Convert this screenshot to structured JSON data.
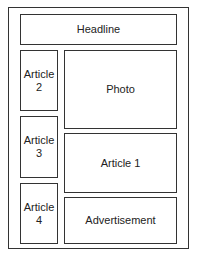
{
  "layout": {
    "headline": {
      "label": "Headline"
    },
    "photo": {
      "label": "Photo"
    },
    "article1": {
      "label": "Article 1"
    },
    "advertisement": {
      "label": "Advertisement"
    },
    "article2": {
      "line1": "Article",
      "line2": "2"
    },
    "article3": {
      "line1": "Article",
      "line2": "3"
    },
    "article4": {
      "line1": "Article",
      "line2": "4"
    }
  },
  "colors": {
    "border": "#333333",
    "background": "#ffffff",
    "text": "#222222"
  }
}
